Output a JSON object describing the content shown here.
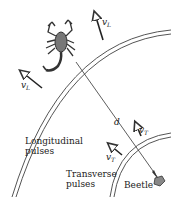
{
  "diagram": {
    "labels": {
      "longitudinal": [
        "Longitudinal",
        "pulses"
      ],
      "transverse": [
        "Transverse",
        "pulses"
      ],
      "beetle": "Beetle",
      "distance": "d",
      "vL": "v",
      "vL_sub": "L",
      "vT": "v",
      "vT_sub": "T"
    },
    "elements": {
      "scorpion-icon": "scorpion",
      "beetle-icon": "beetle"
    },
    "colors": {
      "stroke": "#333333",
      "background": "#ffffff"
    }
  }
}
